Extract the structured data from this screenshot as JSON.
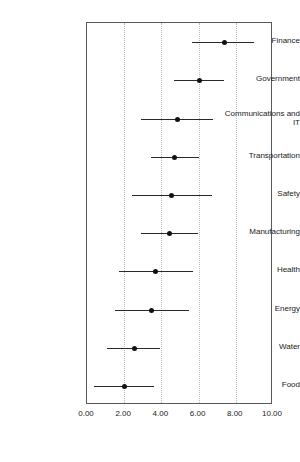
{
  "chart_data": {
    "type": "scatter",
    "title": "",
    "subtitle": "",
    "xlabel": "",
    "ylabel": "",
    "xlim": [
      0.0,
      10.0
    ],
    "xticks": [
      0.0,
      2.0,
      4.0,
      6.0,
      8.0,
      10.0
    ],
    "xtick_labels": [
      "0.00",
      "2.00",
      "4.00",
      "6.00",
      "8.00",
      "10.00"
    ],
    "grid": "vertical-dotted",
    "legend": "none",
    "orientation": "horizontal",
    "marker_color": "#111111",
    "line_color": "#2a2a2a",
    "categories": [
      "Finance",
      "Government",
      "Communications and IT",
      "Transportation",
      "Safety",
      "Manufacturing",
      "Health",
      "Energy",
      "Water",
      "Food"
    ],
    "points": [
      {
        "category": "Finance",
        "value": 7.35,
        "low": 5.65,
        "high": 9.0
      },
      {
        "category": "Government",
        "value": 6.0,
        "low": 4.7,
        "high": 7.35
      },
      {
        "category": "Communications and IT",
        "value": 4.85,
        "low": 2.9,
        "high": 6.75
      },
      {
        "category": "Transportation",
        "value": 4.7,
        "low": 3.45,
        "high": 6.0
      },
      {
        "category": "Safety",
        "value": 4.5,
        "low": 2.4,
        "high": 6.7
      },
      {
        "category": "Manufacturing",
        "value": 4.4,
        "low": 2.9,
        "high": 5.95
      },
      {
        "category": "Health",
        "value": 3.65,
        "low": 1.7,
        "high": 5.7
      },
      {
        "category": "Energy",
        "value": 3.45,
        "low": 1.5,
        "high": 5.5
      },
      {
        "category": "Water",
        "value": 2.55,
        "low": 1.1,
        "high": 3.95
      },
      {
        "category": "Food",
        "value": 1.98,
        "low": 0.4,
        "high": 3.6
      }
    ],
    "values": [
      7.35,
      6.0,
      4.85,
      4.7,
      4.5,
      4.4,
      3.65,
      3.45,
      2.55,
      1.98
    ],
    "low": [
      5.65,
      4.7,
      2.9,
      3.45,
      2.4,
      2.9,
      1.7,
      1.5,
      1.1,
      0.4
    ],
    "high": [
      9.0,
      7.35,
      6.75,
      6.0,
      6.7,
      5.95,
      5.7,
      5.5,
      3.95,
      3.6
    ]
  }
}
